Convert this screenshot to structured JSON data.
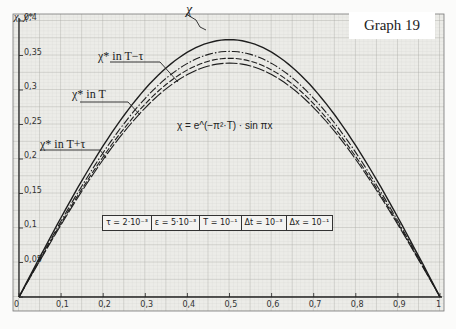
{
  "title": "Graph 19",
  "y_axis_label": "χ, χ*",
  "formula": "χ = e^(−π²·T) · sin πx",
  "parameters": [
    "τ = 2·10⁻³",
    "ε = 5·10⁻³",
    "T = 10⁻¹",
    "Δt = 10⁻³",
    "Δx = 10⁻¹"
  ],
  "annotations": {
    "chi": "χ",
    "chi_star_T_minus_tau": "χ* in T−τ",
    "chi_star_T": "χ* in T",
    "chi_star_T_plus_tau": "χ* in T+τ"
  },
  "chart_data": {
    "type": "line",
    "title": "Graph 19",
    "xlabel": "x",
    "ylabel": "χ, χ*",
    "xlim": [
      0,
      1
    ],
    "ylim": [
      0,
      0.4
    ],
    "grid": true,
    "x_ticks": [
      "0",
      "0,1",
      "0,2",
      "0,3",
      "0,4",
      "0,5",
      "0,6",
      "0,7",
      "0,8",
      "0,9",
      "1"
    ],
    "y_ticks": [
      "0",
      "0,05",
      "0,1",
      "0,15",
      "0,2",
      "0,25",
      "0,3",
      "0,35",
      "0,4"
    ],
    "x": [
      0,
      0.1,
      0.2,
      0.3,
      0.4,
      0.5,
      0.6,
      0.7,
      0.8,
      0.9,
      1.0
    ],
    "series": [
      {
        "name": "χ (exact, χ = e^(−π²T)·sin πx)",
        "style": "solid",
        "values": [
          0,
          0.115,
          0.219,
          0.302,
          0.355,
          0.373,
          0.355,
          0.302,
          0.219,
          0.115,
          0
        ]
      },
      {
        "name": "χ* in T−τ",
        "style": "dash-dot",
        "values": [
          0,
          0.11,
          0.209,
          0.288,
          0.338,
          0.356,
          0.338,
          0.288,
          0.209,
          0.11,
          0
        ]
      },
      {
        "name": "χ* in T",
        "style": "dashed",
        "values": [
          0,
          0.107,
          0.203,
          0.28,
          0.329,
          0.346,
          0.329,
          0.28,
          0.203,
          0.107,
          0
        ]
      },
      {
        "name": "χ* in T+τ",
        "style": "long-dash",
        "values": [
          0,
          0.105,
          0.199,
          0.274,
          0.322,
          0.339,
          0.322,
          0.274,
          0.199,
          0.105,
          0
        ]
      }
    ],
    "annotations": [
      "χ",
      "χ* in T−τ",
      "χ* in T",
      "χ* in T+τ",
      "χ = e^(−π²·T)·sin πx",
      "τ=2·10⁻³ | ε=5·10⁻³ | T=10⁻¹ | Δt=10⁻³ | Δx=10⁻¹"
    ],
    "legend_position": "none (inline labels with leader lines)"
  }
}
